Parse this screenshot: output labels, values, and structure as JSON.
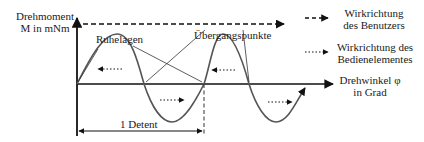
{
  "diagram": {
    "y_axis_label": [
      "Drehmoment",
      "M in mNm"
    ],
    "x_axis_label": [
      "Drehwinkel φ",
      "in Grad"
    ],
    "annotations": {
      "rest_positions": "Ruhelagen",
      "transition_points": "Übergangspunkte",
      "detent_span": "1 Detent"
    },
    "legend": [
      {
        "style": "dashed",
        "label": [
          "Wirkrichtung",
          "des Benutzers"
        ]
      },
      {
        "style": "dotted",
        "label": [
          "Wirkrichtung des",
          "Bedienelementes"
        ]
      }
    ],
    "colors": {
      "axis": "#111111",
      "curve": "#555555",
      "text": "#1a1a1a"
    }
  }
}
